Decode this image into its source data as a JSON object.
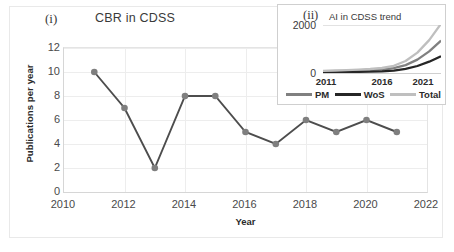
{
  "figure": {
    "panel_i_label": "(i)",
    "panel_ii_label": "(ii)"
  },
  "chart_data": [
    {
      "type": "line",
      "title": "CBR in CDSS",
      "xlabel": "Year",
      "ylabel": "Publications per year",
      "x": [
        2011,
        2012,
        2013,
        2014,
        2015,
        2016,
        2017,
        2018,
        2019,
        2020,
        2021
      ],
      "values": [
        10,
        7,
        2,
        8,
        8,
        5,
        4,
        6,
        5,
        6,
        5
      ],
      "xlim": [
        2010,
        2022
      ],
      "ylim": [
        0,
        12
      ],
      "xticks": [
        "2010",
        "2012",
        "2014",
        "2016",
        "2018",
        "2020",
        "2022"
      ],
      "yticks": [
        "0",
        "2",
        "4",
        "6",
        "8",
        "10",
        "12"
      ],
      "grid": true,
      "legend": "none",
      "marker": "circle",
      "line_color": "#4d4d4d",
      "marker_color": "#7f7f7f"
    },
    {
      "type": "line",
      "title": "AI in CDSS trend",
      "xlabel": "",
      "ylabel": "",
      "xticks": [
        "2011",
        "2016",
        "2021"
      ],
      "yticks": [
        "0",
        "2000"
      ],
      "ylim": [
        0,
        2000
      ],
      "xlim": [
        2011,
        2021
      ],
      "grid": true,
      "legend": "bottom",
      "series": [
        {
          "name": "PM",
          "color": "#808080",
          "x": [
            2011,
            2012,
            2013,
            2014,
            2015,
            2016,
            2017,
            2018,
            2019,
            2020,
            2021
          ],
          "values": [
            60,
            70,
            80,
            95,
            110,
            140,
            200,
            330,
            560,
            900,
            1350
          ]
        },
        {
          "name": "WoS",
          "color": "#262626",
          "x": [
            2011,
            2012,
            2013,
            2014,
            2015,
            2016,
            2017,
            2018,
            2019,
            2020,
            2021
          ],
          "values": [
            30,
            35,
            40,
            48,
            55,
            70,
            100,
            170,
            290,
            470,
            700
          ]
        },
        {
          "name": "Total",
          "color": "#bfbfbf",
          "x": [
            2011,
            2012,
            2013,
            2014,
            2015,
            2016,
            2017,
            2018,
            2019,
            2020,
            2021
          ],
          "values": [
            90,
            105,
            120,
            143,
            165,
            210,
            300,
            500,
            850,
            1370,
            2050
          ]
        }
      ]
    }
  ]
}
